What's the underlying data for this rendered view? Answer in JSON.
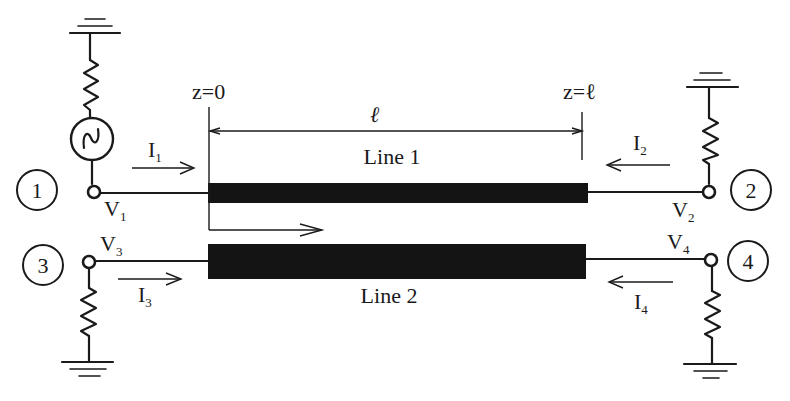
{
  "diagram": {
    "type": "coupled transmission lines circuit",
    "lines": [
      {
        "id": "line1",
        "label": "Line 1"
      },
      {
        "id": "line2",
        "label": "Line 2"
      }
    ],
    "positions": {
      "start_label": "z=0",
      "end_label": "z=ℓ",
      "length_label": "ℓ"
    },
    "ports": [
      {
        "number": "1",
        "voltage": "V",
        "voltage_sub": "1",
        "current": "I",
        "current_sub": "1",
        "termination": "source with series resistor to ground"
      },
      {
        "number": "2",
        "voltage": "V",
        "voltage_sub": "2",
        "current": "I",
        "current_sub": "2",
        "termination": "resistor to ground"
      },
      {
        "number": "3",
        "voltage": "V",
        "voltage_sub": "3",
        "current": "I",
        "current_sub": "3",
        "termination": "resistor to ground"
      },
      {
        "number": "4",
        "voltage": "V",
        "voltage_sub": "4",
        "current": "I",
        "current_sub": "4",
        "termination": "resistor to ground"
      }
    ],
    "colors": {
      "ink": "#1a1a1a",
      "background": "#ffffff"
    }
  }
}
